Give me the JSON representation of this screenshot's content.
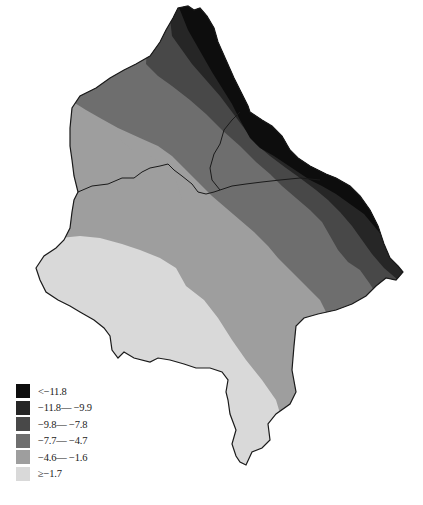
{
  "figure": {
    "type": "choropleth-map",
    "caption_visible": false
  },
  "legend": {
    "items": [
      {
        "label": "<−11.8",
        "color": "#0d0d0d"
      },
      {
        "label": "−11.8— −9.9",
        "color": "#262626"
      },
      {
        "label": "−9.8— −7.8",
        "color": "#484848"
      },
      {
        "label": "−7.7— −4.7",
        "color": "#6e6e6e"
      },
      {
        "label": "−4.6— −1.6",
        "color": "#9e9e9e"
      },
      {
        "label": "≥−1.7",
        "color": "#d9d9d9"
      }
    ]
  },
  "colors": {
    "boundary": "#1a1a1a",
    "background": "#ffffff"
  }
}
